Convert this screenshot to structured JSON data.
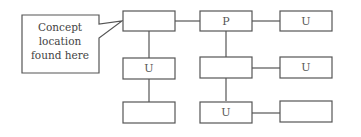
{
  "diagram": {
    "type": "tree-structure",
    "callout": {
      "lines": [
        "Concept",
        "location",
        "found here"
      ],
      "points_to": "box-root"
    },
    "nodes": [
      {
        "id": "box-root",
        "label": ""
      },
      {
        "id": "box-p",
        "label": "P"
      },
      {
        "id": "box-u-top-right",
        "label": "U"
      },
      {
        "id": "box-u-left-mid",
        "label": "U"
      },
      {
        "id": "box-left-bottom",
        "label": ""
      },
      {
        "id": "box-center-mid",
        "label": ""
      },
      {
        "id": "box-u-right-mid",
        "label": "U"
      },
      {
        "id": "box-u-center-bottom",
        "label": "U"
      },
      {
        "id": "box-right-bottom",
        "label": ""
      }
    ],
    "edges": [
      [
        "box-root",
        "box-p"
      ],
      [
        "box-p",
        "box-u-top-right"
      ],
      [
        "box-root",
        "box-u-left-mid"
      ],
      [
        "box-u-left-mid",
        "box-left-bottom"
      ],
      [
        "box-p",
        "box-center-mid"
      ],
      [
        "box-center-mid",
        "box-u-right-mid"
      ],
      [
        "box-center-mid",
        "box-u-center-bottom"
      ],
      [
        "box-u-center-bottom",
        "box-right-bottom"
      ]
    ]
  }
}
